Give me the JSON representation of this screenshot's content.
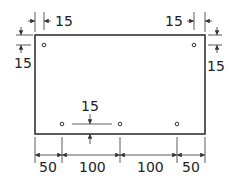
{
  "diagram": {
    "type": "dimensioned-plate-drawing",
    "colors": {
      "line": "#333333",
      "text": "#222222",
      "background": "#ffffff"
    },
    "plate": {
      "x": 35,
      "y": 35,
      "width": 170,
      "height": 99
    },
    "holes": [
      {
        "cx": 44,
        "cy": 45
      },
      {
        "cx": 194,
        "cy": 45
      },
      {
        "cx": 62,
        "cy": 124
      },
      {
        "cx": 120,
        "cy": 124
      },
      {
        "cx": 177,
        "cy": 124
      }
    ],
    "dimensions": {
      "top_left_horizontal": "15",
      "top_left_vertical": "15",
      "top_right_horizontal": "15",
      "top_right_vertical": "15",
      "bottom_hole_offset": "15",
      "bottom_chain": [
        "50",
        "100",
        "100",
        "50"
      ]
    }
  }
}
